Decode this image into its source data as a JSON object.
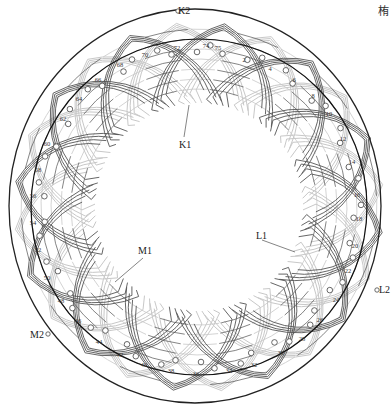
{
  "figure": {
    "type": "stator-winding-diagram",
    "slots": 76,
    "corner_glyph": "栯"
  },
  "geometry": {
    "outer_ring": {
      "cx": 195,
      "cy": 206,
      "rx": 186,
      "ry": 197,
      "color": "#222222",
      "width": 1.3
    },
    "slot_circle": {
      "cx": 199,
      "cy": 207,
      "r": 168,
      "color": "#111111",
      "width": 1.2
    },
    "coil_inner_radius": 108,
    "coil_outer_radius": 185
  },
  "colors": {
    "dark_coil": "#555555",
    "light_coil": "#c8c8c8",
    "slot_marker": "#444444",
    "leader": "#666666"
  },
  "terminals": [
    {
      "id": "K2",
      "label": "K2",
      "x": 178,
      "y": 14,
      "dot_x": 178,
      "dot_y": 11
    },
    {
      "id": "K1",
      "label": "K1",
      "x": 179,
      "y": 148,
      "lead_from": [
        189,
        105
      ],
      "lead_to": [
        184,
        137
      ]
    },
    {
      "id": "L1",
      "label": "L1",
      "x": 256,
      "y": 239,
      "lead_from": [
        262,
        240
      ],
      "lead_to": [
        295,
        252
      ]
    },
    {
      "id": "L2",
      "label": "L2",
      "x": 379,
      "y": 293,
      "dot_x": 377,
      "dot_y": 290
    },
    {
      "id": "M1",
      "label": "M1",
      "x": 138,
      "y": 254,
      "lead_from": [
        143,
        258
      ],
      "lead_to": [
        115,
        282
      ]
    },
    {
      "id": "M2",
      "label": "M2",
      "x": 30,
      "y": 338,
      "dot_x": 48,
      "dot_y": 334
    }
  ],
  "slot_labels": [
    {
      "text": "2",
      "x": 244,
      "y": 62
    },
    {
      "text": "4",
      "x": 270,
      "y": 71
    },
    {
      "text": "6",
      "x": 294,
      "y": 82
    },
    {
      "text": "8",
      "x": 313,
      "y": 98
    },
    {
      "text": "10",
      "x": 329,
      "y": 116
    },
    {
      "text": "12",
      "x": 343,
      "y": 141
    },
    {
      "text": "14",
      "x": 352,
      "y": 164
    },
    {
      "text": "16",
      "x": 357,
      "y": 197
    },
    {
      "text": "18",
      "x": 359,
      "y": 221
    },
    {
      "text": "20",
      "x": 355,
      "y": 248
    },
    {
      "text": "22",
      "x": 348,
      "y": 273
    },
    {
      "text": "24",
      "x": 336,
      "y": 302
    },
    {
      "text": "26",
      "x": 320,
      "y": 322
    },
    {
      "text": "28",
      "x": 302,
      "y": 341
    },
    {
      "text": "30",
      "x": 281,
      "y": 355
    },
    {
      "text": "32",
      "x": 254,
      "y": 367
    },
    {
      "text": "34",
      "x": 229,
      "y": 373
    },
    {
      "text": "36",
      "x": 196,
      "y": 376
    },
    {
      "text": "38",
      "x": 171,
      "y": 373
    },
    {
      "text": "40",
      "x": 144,
      "y": 367
    },
    {
      "text": "42",
      "x": 120,
      "y": 357
    },
    {
      "text": "44",
      "x": 99,
      "y": 344
    },
    {
      "text": "46",
      "x": 78,
      "y": 323
    },
    {
      "text": "48",
      "x": 61,
      "y": 303
    },
    {
      "text": "50",
      "x": 47,
      "y": 280
    },
    {
      "text": "52",
      "x": 38,
      "y": 252
    },
    {
      "text": "54",
      "x": 33,
      "y": 225
    },
    {
      "text": "56",
      "x": 33,
      "y": 198
    },
    {
      "text": "58",
      "x": 38,
      "y": 172
    },
    {
      "text": "60",
      "x": 47,
      "y": 146
    },
    {
      "text": "62",
      "x": 63,
      "y": 121
    },
    {
      "text": "64",
      "x": 79,
      "y": 101
    },
    {
      "text": "66",
      "x": 98,
      "y": 82
    },
    {
      "text": "68",
      "x": 120,
      "y": 67
    },
    {
      "text": "70",
      "x": 145,
      "y": 57
    },
    {
      "text": "72",
      "x": 177,
      "y": 50
    },
    {
      "text": "74",
      "x": 206,
      "y": 48
    },
    {
      "text": "75",
      "x": 218,
      "y": 50
    }
  ],
  "coil_groups": {
    "dark_count": 12,
    "light_count": 12,
    "coils_per_group": 4,
    "span_deg": 68,
    "rotation_offset_deg": 8
  }
}
